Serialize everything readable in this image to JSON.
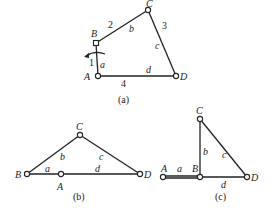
{
  "figure_a": {
    "caption": "(a)",
    "joints": {
      "A": "A",
      "B": "B",
      "C": "C",
      "D": "D"
    },
    "link_numbers": {
      "1": "1",
      "2": "2",
      "3": "3",
      "4": "4"
    },
    "link_lengths": {
      "a": "a",
      "b": "b",
      "c": "c",
      "d": "d"
    }
  },
  "figure_b": {
    "caption": "(b)",
    "joints": {
      "A": "A",
      "B": "B",
      "C": "C",
      "D": "D"
    },
    "link_lengths": {
      "a": "a",
      "b": "b",
      "c": "c",
      "d": "d"
    }
  },
  "figure_c": {
    "caption": "(c)",
    "joints": {
      "A": "A",
      "B": "B",
      "C": "C",
      "D": "D"
    },
    "link_lengths": {
      "a": "a",
      "b": "b",
      "c": "c",
      "d": "d"
    }
  },
  "colors": {
    "line": "#222222",
    "background": "#ffffff"
  }
}
